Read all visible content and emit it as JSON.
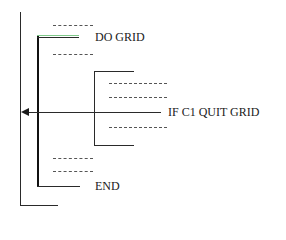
{
  "diagram": {
    "type": "loop-structure",
    "labels": {
      "loop_start": "DO GRID",
      "exit_condition": "IF C1 QUIT GRID",
      "loop_end": "END"
    },
    "colors": {
      "line": "#2a2a2a",
      "highlight": "#7fc98a"
    }
  }
}
